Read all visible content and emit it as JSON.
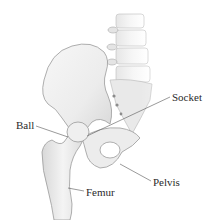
{
  "figure": {
    "labels": {
      "socket": "Socket",
      "ball": "Ball",
      "pelvis": "Pelvis",
      "femur": "Femur"
    },
    "colors": {
      "background": "#ffffff",
      "bone_fill": "#f1f1f1",
      "bone_shade": "#cfcfcf",
      "bone_outline": "#9a9a9a",
      "leader_line": "#555555",
      "label_text": "#2a2a2a"
    }
  }
}
